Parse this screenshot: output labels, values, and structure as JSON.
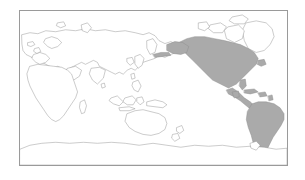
{
  "page": {
    "background_color": "#ffffff",
    "width": 305,
    "height": 180
  },
  "map": {
    "title": "",
    "frame": {
      "border_color": "#9a9a9a",
      "background_color": "#ffffff",
      "x": 19,
      "y": 10,
      "width": 269,
      "height": 156
    },
    "projection": "miller-cylindrical-americas-right",
    "legend_visible": false,
    "labels_visible": false,
    "graticule_visible": false,
    "colors": {
      "highlight_fill": "#aaaaaa",
      "land_fill": "#ffffff",
      "coastline_stroke": "#8d8d8d",
      "ocean_fill": "#ffffff"
    },
    "highlighted_regions": [
      "North America",
      "Central America",
      "Caribbean",
      "South America"
    ],
    "unhighlighted_regions": [
      "Greenland",
      "Europe",
      "Africa",
      "Asia",
      "Australia",
      "New Zealand",
      "Antarctica",
      "Canadian Arctic Archipelago"
    ]
  }
}
